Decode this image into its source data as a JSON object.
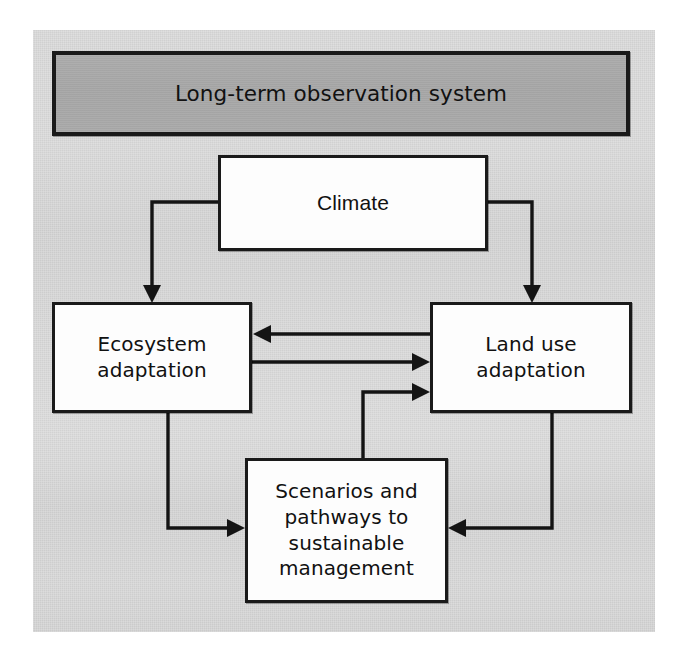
{
  "figure": {
    "kind": "flow-diagram",
    "background_color": "#d4d4d4",
    "outer_color": "#ffffff",
    "line_color": "#141414"
  },
  "banner": {
    "label": "Long-term observation system",
    "fill_color": "#a8a8a8",
    "border_color": "#1a1a1a"
  },
  "nodes": {
    "climate": {
      "label": "Climate",
      "fill_color": "#fdfdfd",
      "border_color": "#1a1a1a"
    },
    "ecosystem": {
      "label": "Ecosystem\nadaptation",
      "fill_color": "#fdfdfd",
      "border_color": "#1a1a1a"
    },
    "landuse": {
      "label": "Land use\nadaptation",
      "fill_color": "#fdfdfd",
      "border_color": "#1a1a1a"
    },
    "scenarios": {
      "label": "Scenarios and\npathways to\nsustainable\nmanagement",
      "fill_color": "#fdfdfd",
      "border_color": "#1a1a1a"
    }
  },
  "connectors": [
    {
      "id": "climate-to-ecosystem",
      "from": "climate",
      "to": "ecosystem",
      "style": "orthogonal",
      "arrow": "single"
    },
    {
      "id": "climate-to-landuse",
      "from": "climate",
      "to": "landuse",
      "style": "orthogonal",
      "arrow": "single"
    },
    {
      "id": "landuse-to-ecosystem",
      "from": "landuse",
      "to": "ecosystem",
      "style": "straight",
      "arrow": "single"
    },
    {
      "id": "ecosystem-to-landuse",
      "from": "ecosystem",
      "to": "landuse",
      "style": "straight",
      "arrow": "single"
    },
    {
      "id": "ecosystem-to-scenarios",
      "from": "ecosystem",
      "to": "scenarios",
      "style": "orthogonal",
      "arrow": "single"
    },
    {
      "id": "landuse-to-scenarios",
      "from": "landuse",
      "to": "scenarios",
      "style": "orthogonal",
      "arrow": "single"
    },
    {
      "id": "scenarios-to-landuse",
      "from": "scenarios",
      "to": "landuse",
      "style": "orthogonal",
      "arrow": "single"
    }
  ]
}
